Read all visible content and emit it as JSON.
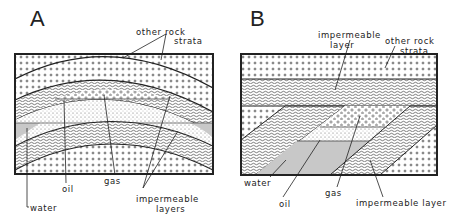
{
  "panels": [
    {
      "id": "A",
      "letter": "A",
      "structure": "anticline",
      "labels": {
        "other_rock_1": "other rock",
        "other_rock_2": "strata",
        "water": "water",
        "oil": "oil",
        "gas": "gas",
        "imperm_1": "impermeable",
        "imperm_2": "layers"
      }
    },
    {
      "id": "B",
      "letter": "B",
      "structure": "fault/unconformity trap",
      "labels": {
        "imperm_top_1": "impermeable",
        "imperm_top_2": "layer",
        "other_rock_1": "other rock",
        "other_rock_2": "strata",
        "water": "water",
        "oil": "oil",
        "gas": "gas",
        "imperm_bottom": "impermeable layer"
      }
    }
  ],
  "colors": {
    "line": "#222222",
    "water_fill": "#c8c8c8",
    "background": "#ffffff"
  }
}
